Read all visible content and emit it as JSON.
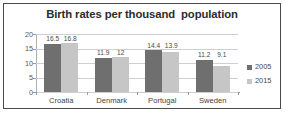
{
  "chart_data": {
    "type": "bar",
    "title": "Birth rates per thousand  population",
    "xlabel": "",
    "ylabel": "",
    "categories": [
      "Croatia",
      "Denmark",
      "Portugal",
      "Sweden"
    ],
    "series": [
      {
        "name": "2005",
        "color": "#6f6f6f",
        "values": [
          16.5,
          11.9,
          14.4,
          11.2
        ],
        "labels": [
          "16.5",
          "11.9",
          "14.4",
          "11.2"
        ]
      },
      {
        "name": "2015",
        "color": "#c6c6c6",
        "values": [
          16.8,
          12.0,
          13.9,
          9.1
        ],
        "labels": [
          "16.8",
          "12",
          "13.9",
          "9.1"
        ]
      }
    ],
    "ylim": [
      0,
      20
    ],
    "yticks": [
      20,
      15,
      10,
      5,
      0
    ],
    "ytick_labels": [
      "20",
      "15",
      "10",
      "5",
      "0"
    ],
    "grid": true,
    "legend_position": "right"
  },
  "legend": {
    "items": [
      {
        "label": "2005",
        "color": "#6f6f6f"
      },
      {
        "label": "2015",
        "color": "#c6c6c6"
      }
    ]
  }
}
